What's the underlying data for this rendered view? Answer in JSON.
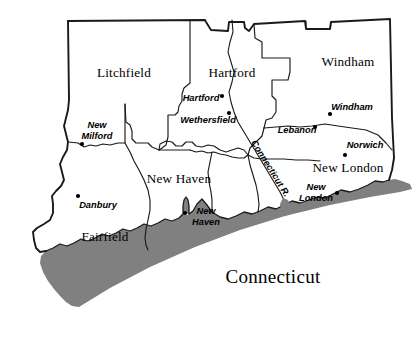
{
  "map": {
    "title": "Connecticut",
    "title_position": {
      "x": 273,
      "y": 283
    },
    "colors": {
      "land": "#ffffff",
      "water": "#808080",
      "outline": "#1a1a1a",
      "label": "#000000",
      "background": "#ffffff"
    },
    "counties": [
      {
        "name": "Litchfield",
        "label_x": 124,
        "label_y": 77
      },
      {
        "name": "Hartford",
        "label_x": 232,
        "label_y": 77
      },
      {
        "name": "Windham",
        "label_x": 348,
        "label_y": 66
      },
      {
        "name": "New Haven",
        "label_x": 179,
        "label_y": 183
      },
      {
        "name": "New London",
        "label_x": 348,
        "label_y": 172
      },
      {
        "name": "Fairfield",
        "label_x": 105,
        "label_y": 241
      }
    ],
    "cities": [
      {
        "name": "Hartford",
        "lines": [
          "Hartford"
        ],
        "label_x": 201,
        "label_y": 101,
        "dot_x": 222,
        "dot_y": 96
      },
      {
        "name": "Wethersfield",
        "lines": [
          "Wethersfield"
        ],
        "label_x": 208,
        "label_y": 123,
        "dot_x": 229,
        "dot_y": 113
      },
      {
        "name": "Windham",
        "lines": [
          "Windham"
        ],
        "label_x": 352,
        "label_y": 110,
        "dot_x": 330,
        "dot_y": 114
      },
      {
        "name": "Lebanon",
        "lines": [
          "Lebanon"
        ],
        "label_x": 297,
        "label_y": 133,
        "dot_x": 315,
        "dot_y": 127
      },
      {
        "name": "Norwich",
        "lines": [
          "Norwich"
        ],
        "label_x": 365,
        "label_y": 148,
        "dot_x": 345,
        "dot_y": 155
      },
      {
        "name": "New London",
        "lines": [
          "New",
          "London"
        ],
        "label_x": 316,
        "label_y": 190,
        "dot_x": 337,
        "dot_y": 193
      },
      {
        "name": "New Milford",
        "lines": [
          "New",
          "Milford"
        ],
        "label_x": 97,
        "label_y": 128,
        "dot_x": 82,
        "dot_y": 144
      },
      {
        "name": "Danbury",
        "lines": [
          "Danbury"
        ],
        "label_x": 98,
        "label_y": 208,
        "dot_x": 78,
        "dot_y": 196
      },
      {
        "name": "New Haven",
        "lines": [
          "New",
          "Haven"
        ],
        "label_x": 206,
        "label_y": 214,
        "dot_x": 185,
        "dot_y": 213
      }
    ],
    "river": {
      "name": "Connecticut R.",
      "label_x": 268,
      "label_y": 170,
      "rotation": 58
    }
  }
}
